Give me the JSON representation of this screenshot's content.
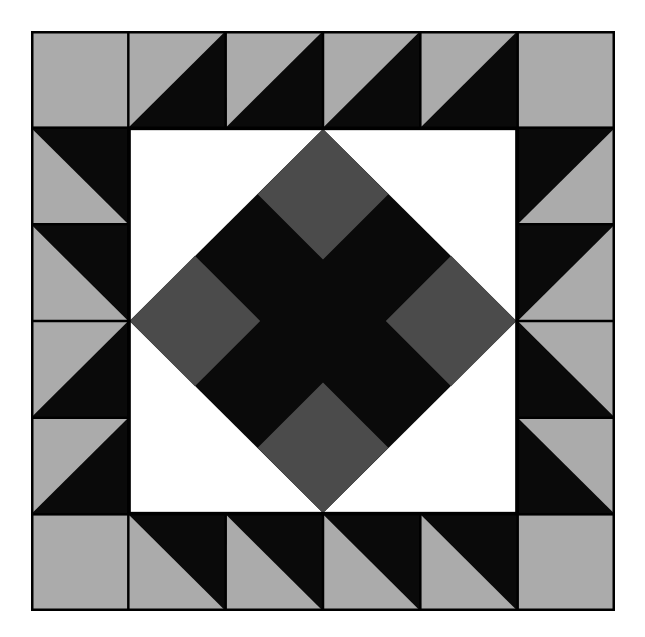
{
  "artwork": {
    "title": "Quilt Block Pattern",
    "kind": "geometric-quilt-block",
    "background_color": "#ffffff"
  },
  "canvas": {
    "width": 645,
    "height": 637
  },
  "block": {
    "x": 31,
    "y": 31,
    "width": 584,
    "height": 580,
    "grid_columns": 6,
    "grid_rows": 6,
    "seam_color": "#000000",
    "seam_width": 2.5
  },
  "palette": {
    "light_gray": "#ababab",
    "black": "#0a0a0a",
    "white": "#ffffff",
    "dark_gray": "#4b4b4b",
    "seam": "#000000"
  },
  "chart_data": {
    "type": "heatmap",
    "xlabel": "",
    "ylabel": "",
    "grid": true,
    "legend_position": "none",
    "categories": [
      "col0",
      "col1",
      "col2",
      "col3",
      "col4",
      "col5"
    ],
    "rows": [
      "row0",
      "row1",
      "row2",
      "row3",
      "row4",
      "row5"
    ],
    "cells": [
      [
        {
          "unit": "solid",
          "fill": "light_gray"
        },
        {
          "unit": "hst",
          "orientation": "tl-gray-br-black",
          "fills": [
            "light_gray",
            "black"
          ]
        },
        {
          "unit": "hst",
          "orientation": "tl-gray-br-black",
          "fills": [
            "light_gray",
            "black"
          ]
        },
        {
          "unit": "hst",
          "orientation": "tl-gray-br-black",
          "fills": [
            "light_gray",
            "black"
          ]
        },
        {
          "unit": "hst",
          "orientation": "tl-gray-br-black",
          "fills": [
            "light_gray",
            "black"
          ]
        },
        {
          "unit": "solid",
          "fill": "light_gray"
        }
      ],
      [
        {
          "unit": "hst",
          "orientation": "bl-gray-tr-black",
          "fills": [
            "light_gray",
            "black"
          ]
        },
        {
          "unit": "center",
          "fill": "white"
        },
        {
          "unit": "center",
          "fill": "white"
        },
        {
          "unit": "center",
          "fill": "white"
        },
        {
          "unit": "center",
          "fill": "white"
        },
        {
          "unit": "hst",
          "orientation": "br-gray-tl-black",
          "fills": [
            "light_gray",
            "black"
          ]
        }
      ],
      [
        {
          "unit": "hst",
          "orientation": "bl-gray-tr-black",
          "fills": [
            "light_gray",
            "black"
          ]
        },
        {
          "unit": "center",
          "fill": "white"
        },
        {
          "unit": "center",
          "fill": "white"
        },
        {
          "unit": "center",
          "fill": "white"
        },
        {
          "unit": "center",
          "fill": "white"
        },
        {
          "unit": "hst",
          "orientation": "br-gray-tl-black",
          "fills": [
            "light_gray",
            "black"
          ]
        }
      ],
      [
        {
          "unit": "hst",
          "orientation": "tl-gray-br-black",
          "fills": [
            "light_gray",
            "black"
          ]
        },
        {
          "unit": "center",
          "fill": "white"
        },
        {
          "unit": "center",
          "fill": "white"
        },
        {
          "unit": "center",
          "fill": "white"
        },
        {
          "unit": "center",
          "fill": "white"
        },
        {
          "unit": "hst",
          "orientation": "tr-gray-bl-black",
          "fills": [
            "light_gray",
            "black"
          ]
        }
      ],
      [
        {
          "unit": "hst",
          "orientation": "tl-gray-br-black",
          "fills": [
            "light_gray",
            "black"
          ]
        },
        {
          "unit": "center",
          "fill": "white"
        },
        {
          "unit": "center",
          "fill": "white"
        },
        {
          "unit": "center",
          "fill": "white"
        },
        {
          "unit": "center",
          "fill": "white"
        },
        {
          "unit": "hst",
          "orientation": "tr-gray-bl-black",
          "fills": [
            "light_gray",
            "black"
          ]
        }
      ],
      [
        {
          "unit": "solid",
          "fill": "light_gray"
        },
        {
          "unit": "hst",
          "orientation": "bl-gray-tr-black",
          "fills": [
            "light_gray",
            "black"
          ]
        },
        {
          "unit": "hst",
          "orientation": "bl-gray-tr-black",
          "fills": [
            "light_gray",
            "black"
          ]
        },
        {
          "unit": "hst",
          "orientation": "bl-gray-tr-black",
          "fills": [
            "light_gray",
            "black"
          ]
        },
        {
          "unit": "hst",
          "orientation": "bl-gray-tr-black",
          "fills": [
            "light_gray",
            "black"
          ]
        },
        {
          "unit": "solid",
          "fill": "light_gray"
        }
      ]
    ],
    "center_medallion": {
      "background": "white",
      "diamond_fill": "black",
      "diamond_points": "north, east, south, west midpoints of inner 4x4 square",
      "accent_squares": 4,
      "accent_fill": "dark_gray",
      "accent_positions": [
        "north",
        "east",
        "south",
        "west"
      ]
    }
  }
}
